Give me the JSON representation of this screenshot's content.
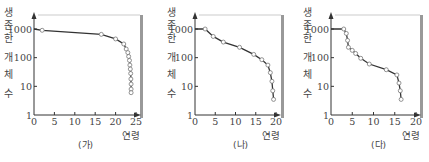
{
  "chart_data": [
    {
      "type": "line",
      "id": "ga",
      "caption": "(가)",
      "ylabel": "생존한 개체 수",
      "ylabel_chars": [
        "생",
        "존",
        "한",
        "개",
        "체",
        "수"
      ],
      "xlabel": "연령",
      "yscale": "log",
      "ylim": [
        1,
        1000
      ],
      "yticks": [
        "1000",
        "100",
        "10",
        "1"
      ],
      "xlim": [
        0,
        25
      ],
      "xticks": [
        "0",
        "5",
        "10",
        "15",
        "20",
        "25"
      ],
      "x": [
        0,
        2,
        16.5,
        20,
        22,
        22.6,
        23,
        23.2,
        23.4,
        23.5,
        23.6,
        23.7,
        23.75,
        23.8,
        23.8,
        23.8
      ],
      "y": [
        1000,
        900,
        650,
        450,
        300,
        200,
        150,
        110,
        80,
        55,
        40,
        28,
        18,
        12,
        8,
        6
      ]
    },
    {
      "type": "line",
      "id": "na",
      "caption": "(나)",
      "ylabel": "생존한 개체 수",
      "ylabel_chars": [
        "생",
        "존",
        "한",
        "개",
        "체",
        "수"
      ],
      "xlabel": "연령",
      "yscale": "log",
      "ylim": [
        1,
        1000
      ],
      "yticks": [
        "1000",
        "100",
        "10",
        "1"
      ],
      "xlim": [
        0,
        20
      ],
      "xticks": [
        "0",
        "5",
        "10",
        "15",
        "20"
      ],
      "x": [
        0,
        2.5,
        4.5,
        7,
        11,
        14.5,
        16.5,
        18,
        18.6,
        19,
        19.2,
        19.4
      ],
      "y": [
        1000,
        1000,
        550,
        350,
        230,
        130,
        85,
        55,
        30,
        15,
        7,
        3.5
      ]
    },
    {
      "type": "line",
      "id": "da",
      "caption": "(다)",
      "ylabel": "생존한 개체 수",
      "ylabel_chars": [
        "생",
        "존",
        "한",
        "개",
        "체",
        "수"
      ],
      "xlabel": "연령",
      "yscale": "log",
      "ylim": [
        1,
        1000
      ],
      "yticks": [
        "1000",
        "100",
        "10",
        "1"
      ],
      "xlim": [
        0,
        20
      ],
      "xticks": [
        "0",
        "5",
        "10",
        "15",
        "20"
      ],
      "x": [
        0,
        3,
        3.6,
        3.9,
        4.1,
        5,
        5.8,
        7,
        9,
        13,
        15.5,
        16,
        16.3,
        16.5
      ],
      "y": [
        1000,
        1000,
        700,
        400,
        230,
        180,
        140,
        95,
        60,
        38,
        25,
        13,
        7,
        3.5
      ]
    }
  ],
  "style": {
    "line_color": "#333333",
    "marker_fill": "#ffffff",
    "marker_stroke": "#777777",
    "axis_color": "#333333",
    "frame_color": "#dddddd",
    "bar_color": "#999999"
  }
}
